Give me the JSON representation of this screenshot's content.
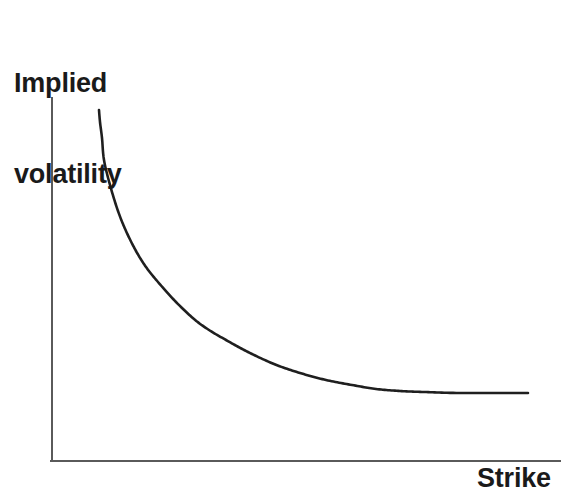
{
  "figure": {
    "background_color": "#ffffff",
    "width": 577,
    "height": 503
  },
  "labels": {
    "y_axis_title_line1": "Implied",
    "y_axis_title_line2": "volatility",
    "x_axis_title": "Strike"
  },
  "style": {
    "axis_color": "#5a5a5a",
    "axis_width": 2,
    "curve_color": "#1f1f1f",
    "curve_width": 2.6,
    "text_color": "#1a1a1a"
  },
  "chart_data": {
    "type": "line",
    "title": "",
    "subtitle": "",
    "xlabel": "Strike",
    "ylabel": "Implied volatility",
    "grid": false,
    "legend": false,
    "legend_position": "none",
    "xlim": [
      0,
      100
    ],
    "ylim": [
      0,
      100
    ],
    "xticks": [],
    "yticks": [],
    "xticklabels": [],
    "yticklabels": [],
    "annotations": [],
    "series": [
      {
        "name": "Implied volatility skew",
        "color": "#1f1f1f",
        "x": [
          9.3,
          9.8,
          10.2,
          11.0,
          13.0,
          15.5,
          17.7,
          20.0,
          22.3,
          25.0,
          29.6,
          34.0,
          37.6,
          41.5,
          46.8,
          53.0,
          59.0,
          65.0,
          71.0,
          76.5,
          82.0,
          87.0,
          91.0,
          94.0
        ],
        "y": [
          96.7,
          93.4,
          89.0,
          83.0,
          76.0,
          69.0,
          63.4,
          58.0,
          53.6,
          49.5,
          43.8,
          39.3,
          36.2,
          33.4,
          30.2,
          27.0,
          24.6,
          22.7,
          21.2,
          20.2,
          19.4,
          18.9,
          18.7,
          18.6
        ],
        "pixel_points": [
          [
            99,
            110
          ],
          [
            100,
            122
          ],
          [
            102,
            138
          ],
          [
            104,
            160
          ],
          [
            110,
            185
          ],
          [
            118,
            211
          ],
          [
            126,
            231
          ],
          [
            136,
            251
          ],
          [
            146,
            267
          ],
          [
            158,
            282
          ],
          [
            176,
            302
          ],
          [
            194,
            319
          ],
          [
            209,
            330
          ],
          [
            226,
            340
          ],
          [
            248,
            352
          ],
          [
            274,
            364
          ],
          [
            300,
            373
          ],
          [
            326,
            380
          ],
          [
            352,
            385
          ],
          [
            376,
            389
          ],
          [
            400,
            391
          ],
          [
            424,
            392
          ],
          [
            460,
            393
          ],
          [
            528,
            393
          ]
        ]
      }
    ],
    "axes_pixels": {
      "y_axis_x": 52,
      "y_axis_top_y": 98,
      "origin_y": 461,
      "x_axis_right_x": 560
    }
  }
}
